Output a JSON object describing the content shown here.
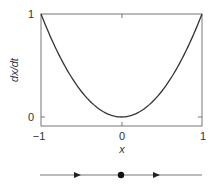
{
  "chart_data": {
    "type": "line",
    "title": "",
    "xlabel": "x",
    "ylabel": "dx/dt",
    "xlim": [
      -1,
      1
    ],
    "ylim": [
      -0.09,
      1
    ],
    "grid": false,
    "legend": null,
    "x_ticks": [
      "−1",
      "0",
      "1"
    ],
    "y_ticks": [
      "0",
      "1"
    ],
    "series": [
      {
        "name": "dx/dt = x^2",
        "x": [
          -1,
          -0.75,
          -0.5,
          -0.25,
          0,
          0.25,
          0.5,
          0.75,
          1
        ],
        "values": [
          1,
          0.5625,
          0.25,
          0.0625,
          0,
          0.0625,
          0.25,
          0.5625,
          1
        ]
      }
    ],
    "phase_line": {
      "fixed_point": {
        "x": 0,
        "type": "semi-stable"
      },
      "arrows": [
        {
          "position": -0.5,
          "direction": "right"
        },
        {
          "position": 0.5,
          "direction": "right"
        }
      ]
    }
  },
  "labels": {
    "xlabel": "x",
    "ylabel": "dx/dt",
    "xtick_left": "−1",
    "xtick_mid": "0",
    "xtick_right": "1",
    "ytick_top": "1",
    "ytick_zero": "0"
  },
  "colors": {
    "axis": "#777777",
    "curve": "#333333",
    "phase_line": "#777777",
    "marker": "#111111"
  }
}
